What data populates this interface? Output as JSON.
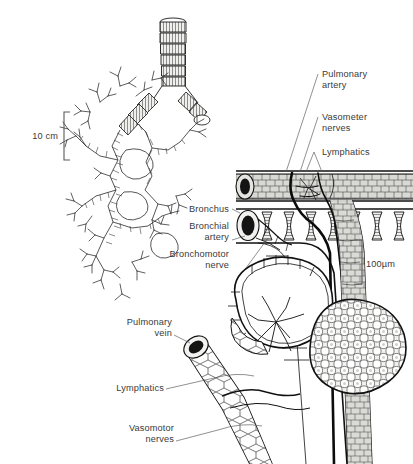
{
  "figure": {
    "background": "#ffffff",
    "ink_color": "#111111",
    "label_color": "#3a3a3a"
  },
  "scale_bars": [
    {
      "id": "macro",
      "text": "10 cm",
      "bracket_side": "right"
    },
    {
      "id": "micro",
      "text": "100µm",
      "bracket_side": "left"
    }
  ],
  "labels": {
    "right": [
      {
        "id": "pulmonary-artery",
        "line1": "Pulmonary",
        "line2": "artery"
      },
      {
        "id": "vasometer-nerves",
        "line1": "Vasometer",
        "line2": "nerves"
      },
      {
        "id": "lymphatics-upper",
        "line1": "Lymphatics",
        "line2": ""
      }
    ],
    "middle": [
      {
        "id": "bronchus",
        "line1": "Bronchus",
        "line2": ""
      },
      {
        "id": "bronchial-artery",
        "line1": "Bronchial",
        "line2": "artery"
      },
      {
        "id": "bronchomotor-nerve",
        "line1": "Bronchomotor",
        "line2": "nerve"
      }
    ],
    "lower": [
      {
        "id": "pulmonary-vein",
        "line1": "Pulmonary",
        "line2": "vein"
      },
      {
        "id": "lymphatics-lower",
        "line1": "Lymphatics",
        "line2": ""
      },
      {
        "id": "vasomotor-nerves",
        "line1": "Vasomotor",
        "line2": "nerves"
      }
    ]
  },
  "structures": {
    "bronchial_tree": "segmented cartilage airway bifurcating into dichotomous branching tree with terminal tufts",
    "pulmonary_artery": "horizontal tube with cobblestone wall and black elliptical lumen",
    "bronchus_tube": "horizontal tube with cartilage rings and black elliptical lumen",
    "alveolar_sacs": "one sac cut open showing septa, one intact with polygonal alveolar surface",
    "pulmonary_vein": "oblique tube with black elliptical lumen and polygonal wall"
  }
}
